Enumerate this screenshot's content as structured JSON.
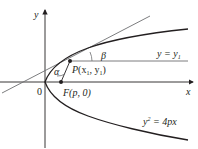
{
  "diagram": {
    "axes": {
      "x_label": "x",
      "y_label": "y",
      "origin_label": "0"
    },
    "points": {
      "P": {
        "label_prefix": "P",
        "label": "(x",
        "sub": "1",
        "mid": ", y",
        "sub2": "1",
        "end": ")"
      },
      "F": {
        "label": "F(p, 0)"
      }
    },
    "angles": {
      "alpha": "α",
      "beta": "β"
    },
    "lines": {
      "horizontal": {
        "label_lhs": "y = y",
        "label_sub": "1"
      }
    },
    "curve": {
      "equation_base": "y",
      "equation_exp": "2",
      "equation_rhs": " = 4px"
    },
    "colors": {
      "stroke": "#231f20",
      "guide": "#6d6e71"
    }
  }
}
